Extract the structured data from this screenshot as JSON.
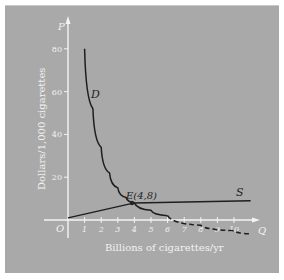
{
  "chart_data": {
    "type": "line",
    "title": "",
    "xlabel": "Billions of cigarettes/yr",
    "ylabel": "Dollars/1,000 cigarettes",
    "x_axis_symbol": "Q",
    "y_axis_symbol": "P",
    "origin_label": "O",
    "xlim": [
      0,
      11
    ],
    "ylim": [
      0,
      85
    ],
    "x_ticks": [
      "1",
      "2",
      "3",
      "4",
      "5",
      "6",
      "7",
      "8",
      "9",
      "10"
    ],
    "y_ticks": [
      "20",
      "40",
      "60",
      "80"
    ],
    "grid": false,
    "legend": "none",
    "series": [
      {
        "name": "D",
        "style": "solid, continues dashed beyond Q≈6",
        "x": [
          1,
          1.5,
          2,
          2.5,
          3,
          3.5,
          4,
          5,
          6,
          8,
          10,
          11
        ],
        "y": [
          80,
          52,
          34,
          22,
          15,
          10.5,
          8,
          4.5,
          2,
          -2.5,
          -5,
          -6.5
        ]
      },
      {
        "name": "S",
        "style": "solid",
        "x": [
          0,
          4,
          11
        ],
        "y": [
          1,
          8,
          9
        ]
      }
    ],
    "annotations": [
      {
        "label": "E(4,8)",
        "x": 4,
        "y": 8,
        "note": "equilibrium point"
      }
    ]
  }
}
